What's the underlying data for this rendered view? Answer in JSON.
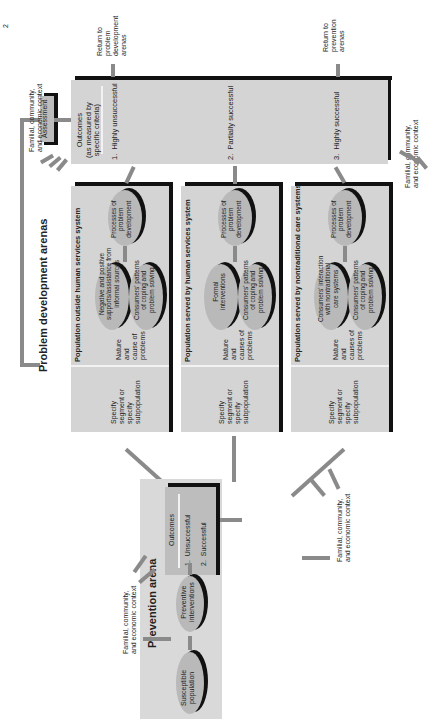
{
  "page_number": "2",
  "problem_development": {
    "title": "Problem development arenas",
    "assessment_label": "Assessment",
    "outcomes": {
      "heading": "Outcomes\n(as measured by\nspecific criteria)",
      "items": [
        "1.  Highly unsuccessful",
        "2.  Partially successful",
        "3.  Highly successful"
      ]
    },
    "return_problem": "Return to\nproblem\ndevelopment\narenas",
    "return_prevention": "Return to\nprevention\narenas",
    "context_top": "Familial, community,\nand economic context",
    "context_right": "Familial, community,\nand economic context",
    "populations": [
      {
        "title": "Population outside human services system",
        "specify": "Specify\nsegment or\nspecify\nsubpopulation",
        "nature": "Nature\nand\ncause of\nproblems",
        "ellipse_a": "Negative and positive\nsupports/assistance from\ninformal sources",
        "ellipse_b": "Consumers' patterns\nof coping and\nproblem solving",
        "process": "Processes of\nproblem\ndevelopment"
      },
      {
        "title": "Population served by human services system",
        "specify": "Specify\nsegment or\nspecify\nsubpopulation",
        "nature": "Nature\nand\ncauses of\nproblems",
        "ellipse_a": "Formal\ninterventions",
        "ellipse_b": "Consumers' patterns\nof coping and\nproblem solving",
        "process": "Processes of\nproblem\ndevelopment"
      },
      {
        "title": "Population served by nontraditional care systems",
        "specify": "Specify\nsegment or\nspecify\nsubpopulation",
        "nature": "Nature\nand\ncauses of\nproblems",
        "ellipse_a": "Consumers' interaction\nwith nontraditional\ncare systems",
        "ellipse_b": "Consumers' patterns\nof coping and\nproblem solving",
        "process": "Processes of\nproblem\ndevelopment"
      }
    ]
  },
  "prevention": {
    "title": "Prevention arena",
    "susceptible": "Susceptible\npopulation",
    "interventions": "Preventive\ninterventions",
    "outcomes_heading": "Outcomes",
    "outcomes_items": [
      "1.  Unsuccessful",
      "2.  Successful"
    ],
    "context_left": "Familial, community,\nand economic context",
    "context_right": "Familial, community,\nand economic context"
  },
  "colors": {
    "panel": "#d4d4d4",
    "ellipse": "#b9b9b9",
    "arrow": "#8a8a8a",
    "shadow": "#111111"
  }
}
